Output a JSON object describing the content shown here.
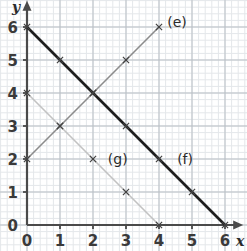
{
  "chart_data": {
    "type": "line",
    "title": "",
    "subtitle": "",
    "xlabel": "x",
    "ylabel": "y",
    "xlim": [
      0,
      6.4
    ],
    "ylim": [
      0,
      6.4
    ],
    "xticks": [
      0,
      1,
      2,
      3,
      4,
      5,
      6
    ],
    "yticks": [
      0,
      1,
      2,
      3,
      4,
      5,
      6
    ],
    "xtick_labels": [
      "0",
      "1",
      "2",
      "3",
      "4",
      "5",
      "6"
    ],
    "ytick_labels": [
      "0",
      "1",
      "2",
      "3",
      "4",
      "5",
      "6"
    ],
    "grid": true,
    "grid_minor_per_unit": 5,
    "legend": "none",
    "annotations": [
      {
        "text": "(e)",
        "x": 4.25,
        "y": 6.15
      },
      {
        "text": "(f)",
        "x": 4.55,
        "y": 2.0
      },
      {
        "text": "(g)",
        "x": 2.45,
        "y": 2.0
      }
    ],
    "series": [
      {
        "name": "(e)",
        "color": "#8c8c8c",
        "width": 1.6,
        "marker": "x",
        "slope": 1,
        "intercept": 2,
        "points": [
          {
            "x": 0,
            "y": 2
          },
          {
            "x": 1,
            "y": 3
          },
          {
            "x": 2,
            "y": 4
          },
          {
            "x": 3,
            "y": 5
          },
          {
            "x": 4,
            "y": 6
          }
        ]
      },
      {
        "name": "(f)",
        "color": "#1e1e1e",
        "width": 2.6,
        "marker": "x",
        "slope": -1,
        "intercept": 6,
        "points": [
          {
            "x": 0,
            "y": 6
          },
          {
            "x": 1,
            "y": 5
          },
          {
            "x": 2,
            "y": 4
          },
          {
            "x": 3,
            "y": 3
          },
          {
            "x": 4,
            "y": 2
          },
          {
            "x": 5,
            "y": 1
          },
          {
            "x": 6,
            "y": 0
          }
        ]
      },
      {
        "name": "(g)",
        "color": "#c2c2c2",
        "width": 1.6,
        "marker": "x",
        "slope": -1,
        "intercept": 4,
        "points": [
          {
            "x": 0,
            "y": 4
          },
          {
            "x": 1,
            "y": 3
          },
          {
            "x": 2,
            "y": 2
          },
          {
            "x": 3,
            "y": 1
          },
          {
            "x": 4,
            "y": 0
          }
        ]
      }
    ],
    "colors": {
      "background": "#ffffff",
      "grid_minor": "#e4e7ea",
      "grid_major": "#b9bfc5",
      "axis": "#4a4a4a",
      "tick_text": "#3a3a3a"
    }
  }
}
